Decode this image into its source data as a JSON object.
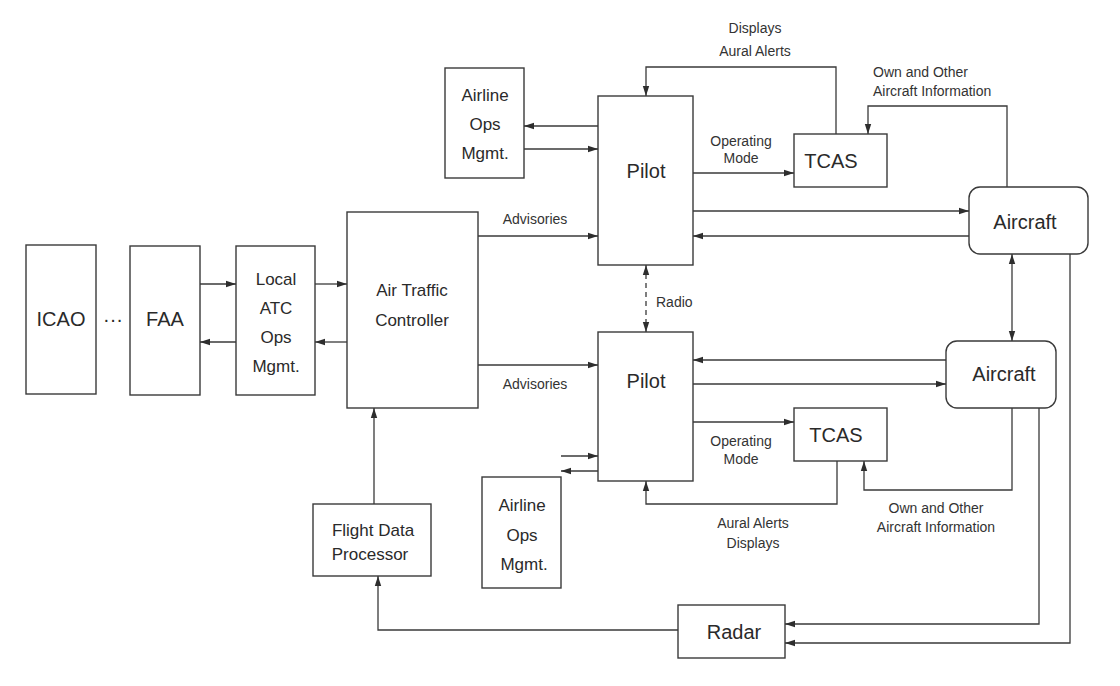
{
  "diagram": {
    "type": "block-diagram",
    "nodes": {
      "icao": {
        "label": "ICAO"
      },
      "ellipsis": {
        "label": "···"
      },
      "faa": {
        "label": "FAA"
      },
      "local_atc": {
        "lines": [
          "Local",
          "ATC",
          "Ops",
          "Mgmt."
        ]
      },
      "atc": {
        "lines": [
          "Air Traffic",
          "Controller"
        ]
      },
      "airline_ops_top": {
        "lines": [
          "Airline",
          "Ops",
          "Mgmt."
        ]
      },
      "airline_ops_bottom": {
        "lines": [
          "Airline",
          "Ops",
          "Mgmt."
        ]
      },
      "pilot_top": {
        "label": "Pilot"
      },
      "pilot_bottom": {
        "label": "Pilot"
      },
      "tcas_top": {
        "label": "TCAS"
      },
      "tcas_bottom": {
        "label": "TCAS"
      },
      "aircraft_top": {
        "label": "Aircraft"
      },
      "aircraft_bottom": {
        "label": "Aircraft"
      },
      "fdp": {
        "lines": [
          "Flight Data",
          "Processor"
        ]
      },
      "radar": {
        "label": "Radar"
      }
    },
    "edge_labels": {
      "displays_aural_top": [
        "Displays",
        "Aural Alerts"
      ],
      "own_other_top": [
        "Own and Other",
        "Aircraft Information"
      ],
      "operating_mode_top": [
        "Operating",
        "Mode"
      ],
      "advisories_top": "Advisories",
      "radio": "Radio",
      "advisories_bottom": "Advisories",
      "operating_mode_bottom": [
        "Operating",
        "Mode"
      ],
      "aural_displays_bottom": [
        "Aural Alerts",
        "Displays"
      ],
      "own_other_bottom": [
        "Own and Other",
        "Aircraft Information"
      ]
    },
    "colors": {
      "stroke": "#3a3a3a",
      "text": "#2a2a2a",
      "background": "#ffffff"
    }
  }
}
